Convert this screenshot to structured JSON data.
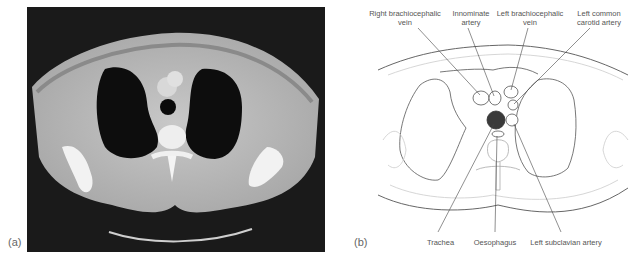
{
  "panels": {
    "a": {
      "label": "(a)",
      "type": "CT scan, axial chest slice"
    },
    "b": {
      "label": "(b)",
      "type": "Line diagram"
    }
  },
  "labels": {
    "top": [
      {
        "line1": "Right brachiocephalic",
        "line2": "vein"
      },
      {
        "line1": "Innominate",
        "line2": "artery"
      },
      {
        "line1": "Left brachiocephalic",
        "line2": "vein"
      },
      {
        "line1": "Left common",
        "line2": "carotid artery"
      }
    ],
    "bottom": [
      {
        "text": "Trachea"
      },
      {
        "text": "Oesophagus"
      },
      {
        "text": "Left subclavian artery"
      }
    ]
  },
  "colors": {
    "ct_background": "#1a1a1a",
    "trachea_fill": "#3a3a3a",
    "outline": "#555555",
    "faint_outline": "#bbbbbb"
  }
}
